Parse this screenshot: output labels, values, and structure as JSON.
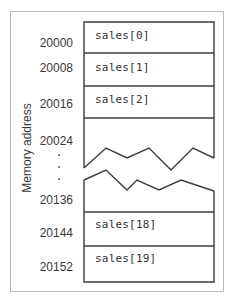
{
  "diagram": {
    "axis_label": "Memory address",
    "addresses": [
      {
        "value": "20000",
        "y": 36
      },
      {
        "value": "20008",
        "y": 61
      },
      {
        "value": "20016",
        "y": 97
      },
      {
        "value": "20024",
        "y": 134
      },
      {
        "value": "20136",
        "y": 193
      },
      {
        "value": "20144",
        "y": 226
      },
      {
        "value": "20152",
        "y": 260
      }
    ],
    "cells": [
      {
        "label": "sales[0]",
        "y": 29
      },
      {
        "label": "sales[1]",
        "y": 61
      },
      {
        "label": "sales[2]",
        "y": 93
      },
      {
        "label": "sales[18]",
        "y": 218
      },
      {
        "label": "sales[19]",
        "y": 252
      }
    ],
    "ellipsis_dots": 3,
    "colors": {
      "line": "#3c3c3c",
      "frame": "#b8b8b8",
      "text": "#333333"
    }
  }
}
